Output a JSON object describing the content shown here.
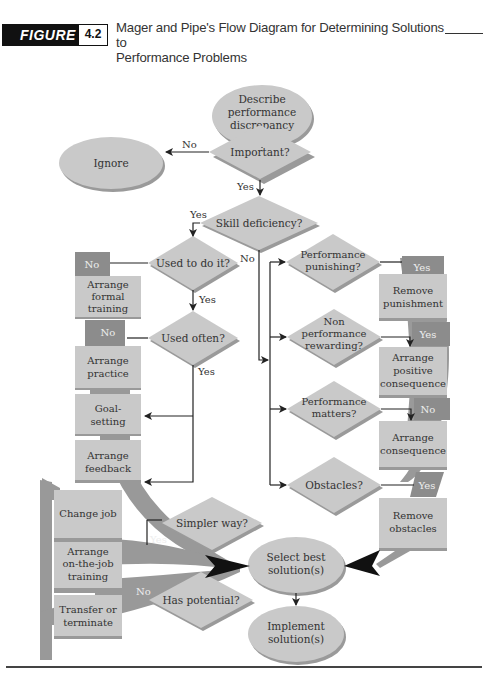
{
  "header": {
    "figure_label": "FIGURE",
    "figure_number": "4.2",
    "title_line1": "Mager and Pipe's Flow Diagram for Determining Solutions to",
    "title_line2": "Performance Problems"
  },
  "colors": {
    "node_fill": "#c9c9c9",
    "node_shadow": "#9a9a9a",
    "label_box_fill": "#8c8c8c",
    "band_fill": "#999999",
    "line": "#222222",
    "text": "#333333"
  },
  "nodes": {
    "start": {
      "line1": "Describe",
      "line2": "performance",
      "line3": "discrepancy"
    },
    "ignore": {
      "label": "Ignore"
    },
    "important": {
      "label": "Important?"
    },
    "skill_deficiency": {
      "label": "Skill deficiency?"
    },
    "used_to_do_it": {
      "label": "Used to do it?"
    },
    "used_often": {
      "label": "Used often?"
    },
    "perf_punishing": {
      "line1": "Performance",
      "line2": "punishing?"
    },
    "non_perf_rewarding": {
      "line1": "Non",
      "line2": "performance",
      "line3": "rewarding?"
    },
    "perf_matters": {
      "line1": "Performance",
      "line2": "matters?"
    },
    "obstacles": {
      "label": "Obstacles?"
    },
    "simpler_way": {
      "label": "Simpler way?"
    },
    "has_potential": {
      "label": "Has potential?"
    },
    "select_best": {
      "line1": "Select best",
      "line2": "solution(s)"
    },
    "implement": {
      "line1": "Implement",
      "line2": "solution(s)"
    }
  },
  "solutions_left": [
    {
      "tag": "No",
      "line1": "Arrange",
      "line2": "formal",
      "line3": "training"
    },
    {
      "tag": "No",
      "line1": "Arrange",
      "line2": "practice"
    },
    {
      "line1": "Goal-",
      "line2": "setting"
    },
    {
      "line1": "Arrange",
      "line2": "feedback"
    }
  ],
  "solutions_bottom_left": [
    {
      "line1": "Change job"
    },
    {
      "line1": "Arrange",
      "line2": "on-the-job",
      "line3": "training"
    },
    {
      "line1": "Transfer or",
      "line2": "terminate"
    }
  ],
  "solutions_right": [
    {
      "tag": "Yes",
      "line1": "Remove",
      "line2": "punishment"
    },
    {
      "tag": "Yes",
      "line1": "Arrange",
      "line2": "positive",
      "line3": "consequence"
    },
    {
      "tag": "No",
      "line1": "Arrange",
      "line2": "consequence"
    },
    {
      "tag": "Yes",
      "line1": "Remove",
      "line2": "obstacles"
    }
  ],
  "edge_labels": {
    "important_no": "No",
    "important_yes": "Yes",
    "skill_yes": "Yes",
    "skill_no": "No",
    "used_to_do_yes": "Yes",
    "used_often_yes": "Yes",
    "simpler_yes": "Yes",
    "potential_no": "No"
  }
}
